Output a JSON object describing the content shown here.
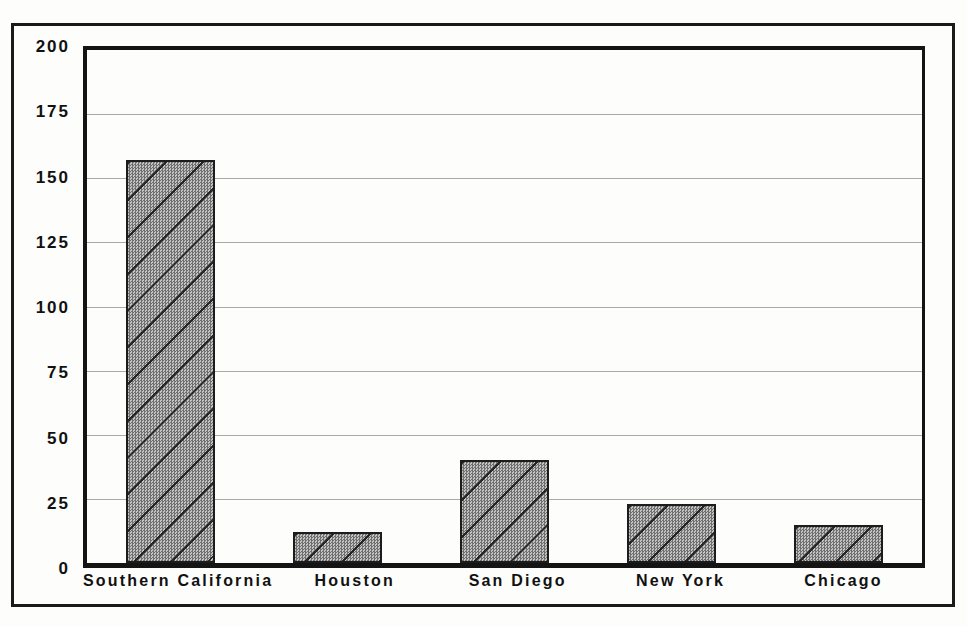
{
  "chart_data": {
    "type": "bar",
    "title": "",
    "subtitle": "",
    "xlabel": "",
    "ylabel": "",
    "categories": [
      "Southern California",
      "Houston",
      "San Diego",
      "New York",
      "Chicago"
    ],
    "values": [
      157,
      12,
      40,
      23,
      15
    ],
    "series": [
      {
        "name": "",
        "values": [
          157,
          12,
          40,
          23,
          15
        ]
      }
    ],
    "ylim": [
      0,
      200
    ],
    "yticks": [
      0,
      25,
      50,
      75,
      100,
      125,
      150,
      175,
      200
    ],
    "ytick_labels": [
      "0",
      "25",
      "50",
      "75",
      "100",
      "125",
      "150",
      "175",
      "200"
    ],
    "grid": true,
    "grid_axis": "y",
    "legend": false,
    "legend_position": "none",
    "bar_fill": "diagonal-hatch-gray",
    "annotations": []
  },
  "style": {
    "background_color": "#fdfdfc",
    "frame_color": "#1a1a1a",
    "axis_color": "#141414",
    "gridline_color": "#a9a9a9",
    "bar_fill_color": "#8a8a8a",
    "bar_edge_color": "#1c1c1c",
    "text_color": "#111111"
  }
}
